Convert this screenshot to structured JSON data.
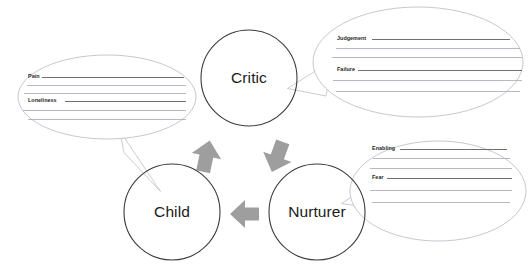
{
  "document": {
    "type": "worksheet-diagram",
    "background_color": "#ffffff"
  },
  "nodes": [
    {
      "id": "critic",
      "label": "Critic",
      "shape": "circle",
      "stroke": "#3b3b3b"
    },
    {
      "id": "child",
      "label": "Child",
      "shape": "circle",
      "stroke": "#3b3b3b"
    },
    {
      "id": "nurturer",
      "label": "Nurturer",
      "shape": "circle",
      "stroke": "#3b3b3b"
    }
  ],
  "arrows": [
    {
      "id": "child-to-critic",
      "from": "Child",
      "to": "Critic",
      "direction": "up",
      "color": "#9e9e9e"
    },
    {
      "id": "critic-to-nurturer",
      "from": "Critic",
      "to": "Nurturer",
      "direction": "down-right",
      "color": "#9e9e9e"
    },
    {
      "id": "nurturer-to-child",
      "from": "Nurturer",
      "to": "Child",
      "direction": "left",
      "color": "#9e9e9e"
    }
  ],
  "callouts": [
    {
      "id": "child-callout",
      "points_to": "Child",
      "position": "left",
      "stroke": "#b9b9c4",
      "rules": 6,
      "labels": [
        {
          "text": "Pain",
          "rule_index": 0
        },
        {
          "text": "Loneliness",
          "rule_index": 3
        }
      ]
    },
    {
      "id": "critic-callout",
      "points_to": "Critic",
      "position": "top-right",
      "stroke": "#b9b9c4",
      "rules": 6,
      "labels": [
        {
          "text": "Judgement",
          "rule_index": 0
        },
        {
          "text": "Failure",
          "rule_index": 3
        }
      ]
    },
    {
      "id": "nurturer-callout",
      "points_to": "Nurturer",
      "position": "bottom-right",
      "stroke": "#b9b9c4",
      "rules": 6,
      "labels": [
        {
          "text": "Enabling",
          "rule_index": 0
        },
        {
          "text": "Fear",
          "rule_index": 3
        }
      ]
    }
  ],
  "top_artifact": {
    "visible": true,
    "description": "faint cropped text remnants along top edge",
    "fragments": [
      "",
      "",
      "",
      ""
    ]
  }
}
